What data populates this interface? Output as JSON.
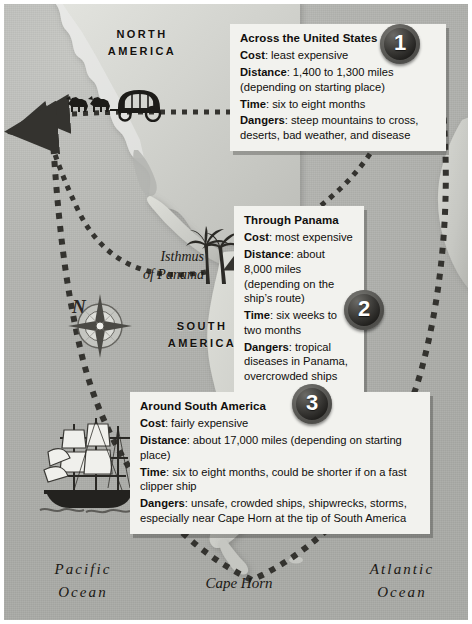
{
  "figure": {
    "name": "routes-to-california-map",
    "style": "antique grayscale world map"
  },
  "map_labels": {
    "north_america": "NORTH\nAMERICA",
    "south_america": "SOUTH\nAMERICA",
    "isthmus_of_panama": "Isthmus\nof Panama",
    "pacific_ocean": "Pacific\nOcean",
    "atlantic_ocean": "Atlantic\nOcean",
    "cape_horn": "Cape Horn",
    "compass_north": "N"
  },
  "illustrations": {
    "wagon": "covered-wagon-icon",
    "palm": "palm-tree-icon",
    "ship": "clipper-ship-icon",
    "compass": "compass-rose-icon"
  },
  "routes": [
    {
      "number": "1",
      "title": "Across the United States",
      "rows": [
        {
          "label": "Cost",
          "value": "least expensive"
        },
        {
          "label": "Distance",
          "value": "1,400 to 1,300 miles (depending on starting place)"
        },
        {
          "label": "Time",
          "value": "six to eight months"
        },
        {
          "label": "Dangers",
          "value": "steep mountains to cross, deserts, bad weather, and disease"
        }
      ]
    },
    {
      "number": "2",
      "title": "Through Panama",
      "rows": [
        {
          "label": "Cost",
          "value": "most expensive"
        },
        {
          "label": "Distance",
          "value": "about 8,000 miles (depending on the ship’s route)"
        },
        {
          "label": "Time",
          "value": "six weeks to two months"
        },
        {
          "label": "Dangers",
          "value": "tropical diseases in Panama, overcrowded ships"
        }
      ]
    },
    {
      "number": "3",
      "title": "Around South America",
      "rows": [
        {
          "label": "Cost",
          "value": "fairly expensive"
        },
        {
          "label": "Distance",
          "value": "about 17,000 miles (depending on starting place)"
        },
        {
          "label": "Time",
          "value": "six to eight months, could be shorter if on a fast clipper ship"
        },
        {
          "label": "Dangers",
          "value": "unsafe, crowded ships, shipwrecks, storms, especially near Cape Horn at the tip of South America"
        }
      ]
    }
  ],
  "colors": {
    "ocean": "#b3b4b0",
    "land": "#cfd0cb",
    "card_background": "#f2f2ee",
    "badge": "#2b2a27",
    "badge_text": "#ffffff",
    "route_dash": "#34332f",
    "frame": "#ffffff"
  }
}
